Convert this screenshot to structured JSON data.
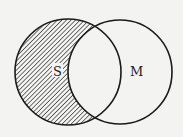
{
  "diagram": {
    "type": "venn",
    "sets": [
      {
        "id": "S",
        "label": "S",
        "cx": 68,
        "cy": 72,
        "r": 53
      },
      {
        "id": "M",
        "label": "M",
        "cx": 120,
        "cy": 72,
        "r": 52
      }
    ],
    "shaded_region": "S minus M",
    "colors": {
      "background": "#f3f3f1",
      "stroke": "#1a1a1a",
      "hatch": "#2a2a2a"
    }
  }
}
